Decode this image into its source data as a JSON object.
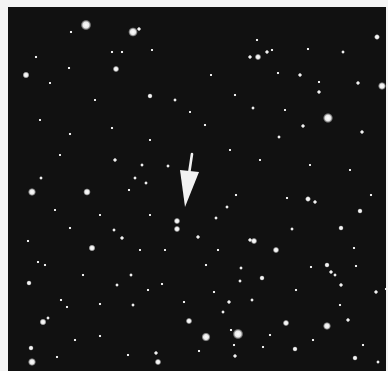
{
  "image": {
    "subject": "star field photograph",
    "background_color": "#111111",
    "border_color": "#f4f4f4",
    "frame": {
      "x": 8,
      "y": 7,
      "width": 378,
      "height": 364
    }
  },
  "arrow": {
    "color": "#f2f2f2",
    "shaft": {
      "x1": 192,
      "y1": 154,
      "x2": 189,
      "y2": 174
    },
    "head": [
      [
        180,
        170
      ],
      [
        199,
        172
      ],
      [
        185,
        207
      ]
    ]
  },
  "marked_object": [
    {
      "x": 177,
      "y": 221,
      "r": 2.4
    },
    {
      "x": 177,
      "y": 229,
      "r": 2.4
    }
  ],
  "stars": [
    {
      "x": 86,
      "y": 25,
      "r": 4.0
    },
    {
      "x": 133,
      "y": 32,
      "r": 3.6
    },
    {
      "x": 139,
      "y": 29,
      "r": 1.6
    },
    {
      "x": 71,
      "y": 32,
      "r": 1.2
    },
    {
      "x": 26,
      "y": 75,
      "r": 2.6
    },
    {
      "x": 116,
      "y": 69,
      "r": 2.4
    },
    {
      "x": 150,
      "y": 96,
      "r": 2.0
    },
    {
      "x": 175,
      "y": 100,
      "r": 1.4
    },
    {
      "x": 112,
      "y": 52,
      "r": 1.2
    },
    {
      "x": 122,
      "y": 52,
      "r": 1.2
    },
    {
      "x": 152,
      "y": 50,
      "r": 1.0
    },
    {
      "x": 250,
      "y": 57,
      "r": 1.6
    },
    {
      "x": 258,
      "y": 57,
      "r": 2.4
    },
    {
      "x": 267,
      "y": 52,
      "r": 1.6
    },
    {
      "x": 272,
      "y": 50,
      "r": 1.2
    },
    {
      "x": 257,
      "y": 40,
      "r": 1.2
    },
    {
      "x": 308,
      "y": 49,
      "r": 1.2
    },
    {
      "x": 343,
      "y": 52,
      "r": 1.4
    },
    {
      "x": 377,
      "y": 37,
      "r": 2.2
    },
    {
      "x": 382,
      "y": 86,
      "r": 3.0
    },
    {
      "x": 358,
      "y": 83,
      "r": 1.6
    },
    {
      "x": 319,
      "y": 92,
      "r": 1.6
    },
    {
      "x": 300,
      "y": 75,
      "r": 1.6
    },
    {
      "x": 328,
      "y": 118,
      "r": 3.8
    },
    {
      "x": 303,
      "y": 126,
      "r": 1.6
    },
    {
      "x": 279,
      "y": 137,
      "r": 1.4
    },
    {
      "x": 253,
      "y": 108,
      "r": 1.4
    },
    {
      "x": 278,
      "y": 73,
      "r": 1.2
    },
    {
      "x": 319,
      "y": 82,
      "r": 1.2
    },
    {
      "x": 362,
      "y": 132,
      "r": 1.6
    },
    {
      "x": 69,
      "y": 68,
      "r": 1.2
    },
    {
      "x": 50,
      "y": 83,
      "r": 1.0
    },
    {
      "x": 36,
      "y": 57,
      "r": 1.2
    },
    {
      "x": 112,
      "y": 128,
      "r": 1.2
    },
    {
      "x": 70,
      "y": 134,
      "r": 1.2
    },
    {
      "x": 32,
      "y": 192,
      "r": 3.0
    },
    {
      "x": 87,
      "y": 192,
      "r": 2.8
    },
    {
      "x": 41,
      "y": 178,
      "r": 1.4
    },
    {
      "x": 115,
      "y": 160,
      "r": 1.6
    },
    {
      "x": 142,
      "y": 165,
      "r": 1.4
    },
    {
      "x": 168,
      "y": 166,
      "r": 1.4
    },
    {
      "x": 135,
      "y": 178,
      "r": 1.4
    },
    {
      "x": 129,
      "y": 190,
      "r": 1.2
    },
    {
      "x": 146,
      "y": 183,
      "r": 1.4
    },
    {
      "x": 114,
      "y": 230,
      "r": 1.4
    },
    {
      "x": 122,
      "y": 238,
      "r": 1.6
    },
    {
      "x": 92,
      "y": 248,
      "r": 2.6
    },
    {
      "x": 70,
      "y": 228,
      "r": 1.2
    },
    {
      "x": 28,
      "y": 241,
      "r": 1.2
    },
    {
      "x": 38,
      "y": 262,
      "r": 1.2
    },
    {
      "x": 29,
      "y": 283,
      "r": 2.0
    },
    {
      "x": 43,
      "y": 322,
      "r": 2.6
    },
    {
      "x": 31,
      "y": 348,
      "r": 2.0
    },
    {
      "x": 32,
      "y": 362,
      "r": 3.0
    },
    {
      "x": 57,
      "y": 357,
      "r": 1.2
    },
    {
      "x": 48,
      "y": 318,
      "r": 1.4
    },
    {
      "x": 67,
      "y": 307,
      "r": 1.2
    },
    {
      "x": 100,
      "y": 304,
      "r": 1.2
    },
    {
      "x": 131,
      "y": 275,
      "r": 1.4
    },
    {
      "x": 117,
      "y": 285,
      "r": 1.4
    },
    {
      "x": 148,
      "y": 290,
      "r": 1.2
    },
    {
      "x": 133,
      "y": 305,
      "r": 1.4
    },
    {
      "x": 128,
      "y": 355,
      "r": 1.2
    },
    {
      "x": 156,
      "y": 353,
      "r": 1.6
    },
    {
      "x": 158,
      "y": 362,
      "r": 2.4
    },
    {
      "x": 189,
      "y": 321,
      "r": 2.4
    },
    {
      "x": 206,
      "y": 337,
      "r": 3.4
    },
    {
      "x": 238,
      "y": 334,
      "r": 4.0
    },
    {
      "x": 231,
      "y": 330,
      "r": 1.2
    },
    {
      "x": 234,
      "y": 345,
      "r": 1.2
    },
    {
      "x": 235,
      "y": 356,
      "r": 1.6
    },
    {
      "x": 223,
      "y": 312,
      "r": 1.4
    },
    {
      "x": 286,
      "y": 323,
      "r": 2.4
    },
    {
      "x": 295,
      "y": 349,
      "r": 2.0
    },
    {
      "x": 327,
      "y": 326,
      "r": 3.0
    },
    {
      "x": 348,
      "y": 320,
      "r": 1.6
    },
    {
      "x": 355,
      "y": 358,
      "r": 2.0
    },
    {
      "x": 363,
      "y": 345,
      "r": 1.2
    },
    {
      "x": 378,
      "y": 362,
      "r": 1.4
    },
    {
      "x": 340,
      "y": 305,
      "r": 1.2
    },
    {
      "x": 263,
      "y": 347,
      "r": 1.2
    },
    {
      "x": 252,
      "y": 300,
      "r": 1.4
    },
    {
      "x": 229,
      "y": 302,
      "r": 1.6
    },
    {
      "x": 198,
      "y": 237,
      "r": 1.6
    },
    {
      "x": 216,
      "y": 218,
      "r": 1.4
    },
    {
      "x": 227,
      "y": 207,
      "r": 1.4
    },
    {
      "x": 236,
      "y": 195,
      "r": 1.2
    },
    {
      "x": 254,
      "y": 241,
      "r": 2.4
    },
    {
      "x": 250,
      "y": 240,
      "r": 1.6
    },
    {
      "x": 276,
      "y": 250,
      "r": 2.4
    },
    {
      "x": 262,
      "y": 278,
      "r": 2.0
    },
    {
      "x": 241,
      "y": 268,
      "r": 1.4
    },
    {
      "x": 240,
      "y": 281,
      "r": 1.4
    },
    {
      "x": 308,
      "y": 199,
      "r": 2.2
    },
    {
      "x": 315,
      "y": 202,
      "r": 1.6
    },
    {
      "x": 341,
      "y": 228,
      "r": 2.0
    },
    {
      "x": 360,
      "y": 211,
      "r": 2.0
    },
    {
      "x": 327,
      "y": 265,
      "r": 2.0
    },
    {
      "x": 331,
      "y": 272,
      "r": 1.6
    },
    {
      "x": 335,
      "y": 275,
      "r": 1.4
    },
    {
      "x": 341,
      "y": 285,
      "r": 1.6
    },
    {
      "x": 292,
      "y": 229,
      "r": 1.4
    },
    {
      "x": 287,
      "y": 198,
      "r": 1.2
    },
    {
      "x": 371,
      "y": 195,
      "r": 1.2
    },
    {
      "x": 376,
      "y": 292,
      "r": 1.6
    },
    {
      "x": 386,
      "y": 289,
      "r": 1.2
    },
    {
      "x": 214,
      "y": 292,
      "r": 1.2
    },
    {
      "x": 206,
      "y": 265,
      "r": 1.2
    },
    {
      "x": 184,
      "y": 302,
      "r": 1.2
    },
    {
      "x": 162,
      "y": 284,
      "r": 1.2
    },
    {
      "x": 218,
      "y": 250,
      "r": 1.2
    },
    {
      "x": 296,
      "y": 290,
      "r": 1.2
    },
    {
      "x": 311,
      "y": 267,
      "r": 1.2
    },
    {
      "x": 354,
      "y": 248,
      "r": 1.2
    },
    {
      "x": 356,
      "y": 266,
      "r": 1.2
    },
    {
      "x": 61,
      "y": 300,
      "r": 1.2
    },
    {
      "x": 83,
      "y": 275,
      "r": 1.2
    },
    {
      "x": 45,
      "y": 265,
      "r": 1.2
    },
    {
      "x": 100,
      "y": 336,
      "r": 1.2
    },
    {
      "x": 75,
      "y": 340,
      "r": 1.2
    },
    {
      "x": 199,
      "y": 351,
      "r": 1.2
    },
    {
      "x": 270,
      "y": 335,
      "r": 1.2
    },
    {
      "x": 313,
      "y": 340,
      "r": 1.2
    },
    {
      "x": 205,
      "y": 125,
      "r": 1.2
    },
    {
      "x": 235,
      "y": 95,
      "r": 1.2
    },
    {
      "x": 211,
      "y": 75,
      "r": 1.0
    },
    {
      "x": 190,
      "y": 112,
      "r": 1.0
    },
    {
      "x": 285,
      "y": 110,
      "r": 1.0
    },
    {
      "x": 230,
      "y": 150,
      "r": 1.0
    },
    {
      "x": 260,
      "y": 160,
      "r": 1.0
    },
    {
      "x": 310,
      "y": 165,
      "r": 1.0
    },
    {
      "x": 350,
      "y": 170,
      "r": 1.0
    },
    {
      "x": 95,
      "y": 100,
      "r": 1.0
    },
    {
      "x": 40,
      "y": 120,
      "r": 1.0
    },
    {
      "x": 60,
      "y": 155,
      "r": 1.0
    },
    {
      "x": 150,
      "y": 140,
      "r": 1.0
    },
    {
      "x": 165,
      "y": 250,
      "r": 1.0
    },
    {
      "x": 150,
      "y": 215,
      "r": 1.0
    },
    {
      "x": 100,
      "y": 215,
      "r": 1.0
    },
    {
      "x": 140,
      "y": 250,
      "r": 1.0
    },
    {
      "x": 55,
      "y": 210,
      "r": 1.0
    }
  ]
}
